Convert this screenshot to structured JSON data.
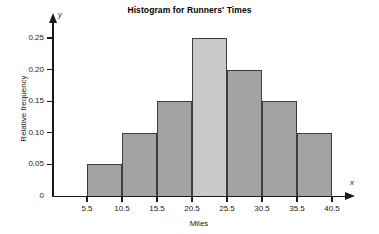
{
  "chart_data": {
    "type": "bar",
    "title": "Histogram for Runners' Times",
    "xlabel": "Miles",
    "ylabel": "Relative frequency",
    "x_axis_letter": "x",
    "y_axis_letter": "y",
    "grid": false,
    "legend": "none",
    "bin_edges": [
      5.5,
      10.5,
      15.5,
      20.5,
      25.5,
      30.5,
      35.5,
      40.5
    ],
    "categories": [
      "5.5-10.5",
      "10.5-15.5",
      "15.5-20.5",
      "20.5-25.5",
      "25.5-30.5",
      "30.5-35.5",
      "35.5-40.5"
    ],
    "values": [
      0.05,
      0.1,
      0.15,
      0.25,
      0.2,
      0.15,
      0.1
    ],
    "bar_colors": [
      "#a3a3a3",
      "#a3a3a3",
      "#a3a3a3",
      "#c9c9c9",
      "#a3a3a3",
      "#a3a3a3",
      "#a3a3a3"
    ],
    "bar_border_color": "#3d3d3d",
    "highlighted_bin_index": 3,
    "xlim": [
      5.5,
      40.5
    ],
    "ylim": [
      0,
      0.25
    ],
    "x_ticks": [
      "5.5",
      "10.5",
      "15.5",
      "20.5",
      "25.5",
      "30.5",
      "35.5",
      "40.5"
    ],
    "x_tick_values": [
      5.5,
      10.5,
      15.5,
      20.5,
      25.5,
      30.5,
      35.5,
      40.5
    ],
    "y_ticks": [
      "0",
      "0.05",
      "0.10",
      "0.15",
      "0.20",
      "0.25"
    ],
    "y_tick_values": [
      0,
      0.05,
      0.1,
      0.15,
      0.2,
      0.25
    ]
  },
  "geometry": {
    "baseline_y": 196,
    "top_y": 38,
    "x_origin": 87,
    "x_step_px": 35,
    "value_top": 0.25
  }
}
